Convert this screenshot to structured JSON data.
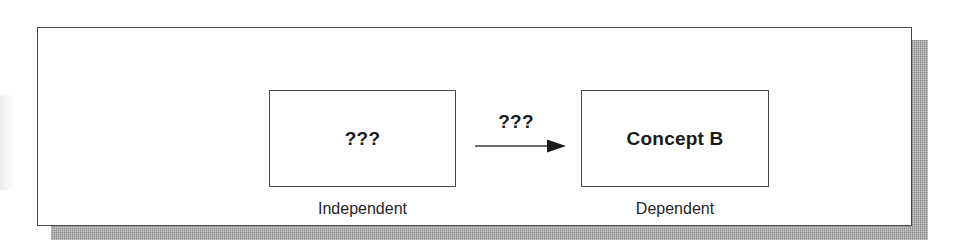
{
  "diagram": {
    "frame": {
      "name": "outer-frame"
    },
    "nodes": [
      {
        "id": "independent",
        "label": "???",
        "caption": "Independent"
      },
      {
        "id": "dependent",
        "label": "Concept B",
        "caption": "Dependent"
      }
    ],
    "edge": {
      "label": "???",
      "direction": "left-to-right",
      "from": "independent",
      "to": "dependent"
    },
    "colors": {
      "ink": "#1a1a1a",
      "line": "#4a4a4a",
      "shadow": "#8a8a8a",
      "background": "#ffffff"
    }
  }
}
